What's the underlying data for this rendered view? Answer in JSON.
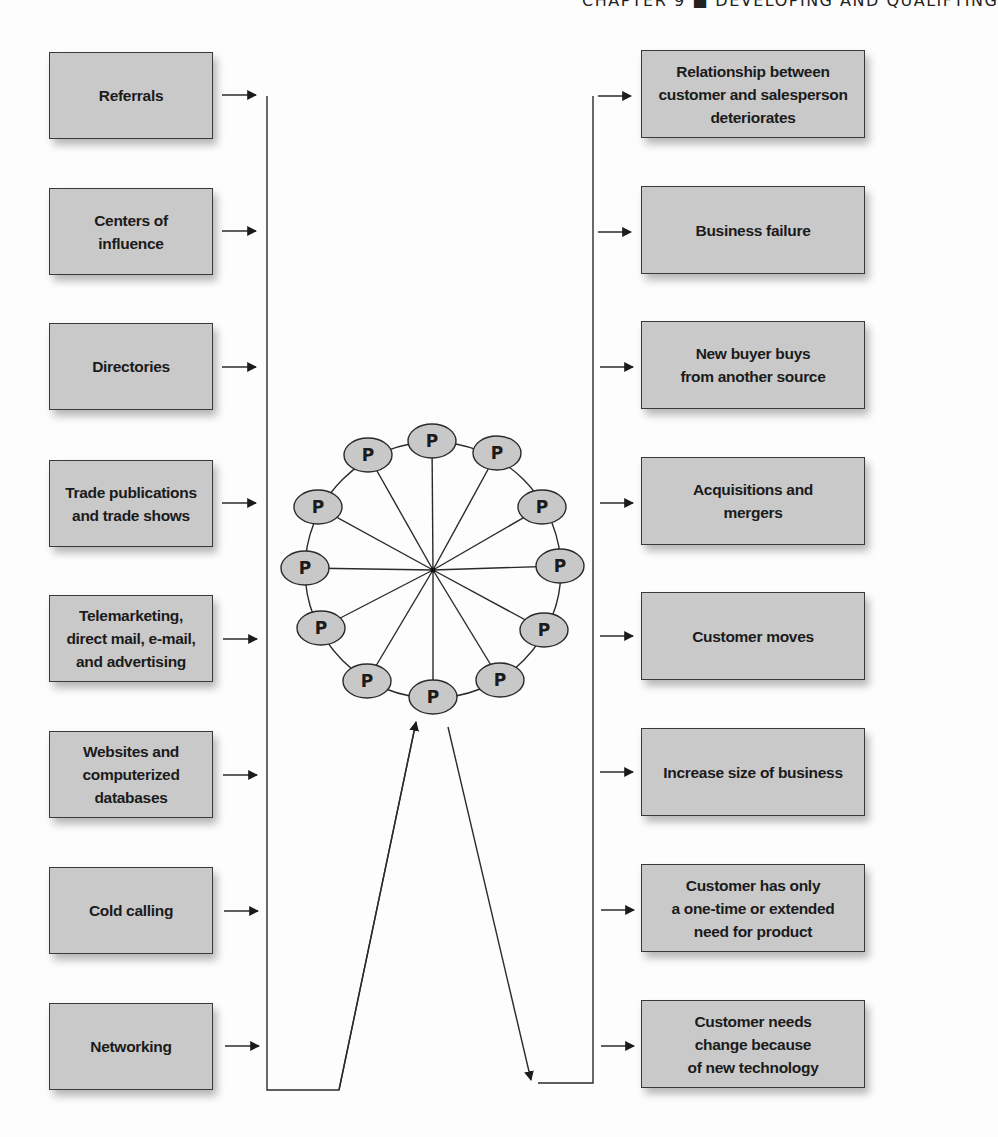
{
  "header": {
    "running_head": "CHAPTER 9 ■ DEVELOPING AND QUALIFYING"
  },
  "diagram": {
    "type": "flow",
    "left_column_title": "",
    "sources": [
      {
        "label": "Referrals"
      },
      {
        "label": "Centers of\ninfluence"
      },
      {
        "label": "Directories"
      },
      {
        "label": "Trade publications\nand trade shows"
      },
      {
        "label": "Telemarketing,\ndirect mail, e-mail,\nand advertising"
      },
      {
        "label": "Websites and\ncomputerized\ndatabases"
      },
      {
        "label": "Cold calling"
      },
      {
        "label": "Networking"
      }
    ],
    "outcomes": [
      {
        "label": "Relationship between\ncustomer and salesperson\ndeteriorates"
      },
      {
        "label": "Business failure"
      },
      {
        "label": "New buyer buys\nfrom another source"
      },
      {
        "label": "Acquisitions and\nmergers"
      },
      {
        "label": "Customer moves"
      },
      {
        "label": "Increase size of business"
      },
      {
        "label": "Customer has only\na one-time or extended\nneed  for product"
      },
      {
        "label": "Customer needs\nchange because\nof new technology"
      }
    ],
    "wheel": {
      "node_label": "P",
      "node_count": 12,
      "nodes": [
        {
          "label": "P"
        },
        {
          "label": "P"
        },
        {
          "label": "P"
        },
        {
          "label": "P"
        },
        {
          "label": "P"
        },
        {
          "label": "P"
        },
        {
          "label": "P"
        },
        {
          "label": "P"
        },
        {
          "label": "P"
        },
        {
          "label": "P"
        },
        {
          "label": "P"
        },
        {
          "label": "P"
        }
      ]
    },
    "colors": {
      "box_fill": "#c9c9c9",
      "node_fill": "#c8c8c8",
      "line": "#2a2a2a",
      "text": "#1b1b1b"
    }
  }
}
